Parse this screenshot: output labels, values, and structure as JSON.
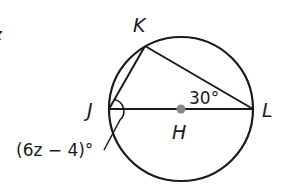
{
  "diagram": {
    "type": "inscribed-triangle-in-circle",
    "circle": {
      "center_label": "H",
      "cx": 181,
      "cy": 109,
      "r": 72
    },
    "points": {
      "J": {
        "label": "J",
        "x": 109,
        "y": 109
      },
      "K": {
        "label": "K",
        "x": 145,
        "y": 46
      },
      "L": {
        "label": "L",
        "x": 253,
        "y": 109
      },
      "H": {
        "label": "H",
        "x": 181,
        "y": 109
      }
    },
    "segments": [
      "JK",
      "KL",
      "JL"
    ],
    "angle_labels": {
      "L": "30°",
      "J": "(6z − 4)°"
    },
    "edge_fragment": "z",
    "colors": {
      "stroke": "#1a1a1a",
      "center_dot": "#888888"
    }
  }
}
